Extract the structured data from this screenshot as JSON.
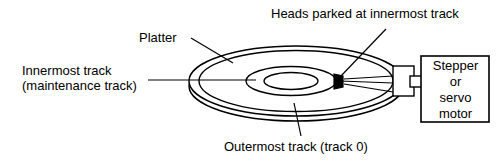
{
  "diagram": {
    "stroke_color": "#000000",
    "fill_color": "#ffffff",
    "head_color": "#000000",
    "background": "#ffffff",
    "labels": {
      "platter": "Platter",
      "heads": "Heads parked at innermost track",
      "innermost_line1": "Innermost track",
      "innermost_line2": "(maintenance track)",
      "outermost": "Outermost track (track 0)"
    },
    "motor": {
      "line1": "Stepper",
      "line2": "or",
      "line3": "servo",
      "line4": "motor"
    },
    "parts": [
      {
        "name": "platter-outer-edge",
        "shape": "ellipse"
      },
      {
        "name": "platter-top-surface",
        "shape": "ellipse"
      },
      {
        "name": "innermost-track-ring",
        "shape": "ellipse"
      },
      {
        "name": "spindle-hole",
        "shape": "ellipse"
      },
      {
        "name": "read-write-head",
        "shape": "rect"
      },
      {
        "name": "actuator-arm",
        "shape": "line"
      },
      {
        "name": "spindle-hub",
        "shape": "rect"
      },
      {
        "name": "motor-shaft",
        "shape": "rect"
      },
      {
        "name": "motor-box",
        "shape": "rect"
      }
    ]
  }
}
